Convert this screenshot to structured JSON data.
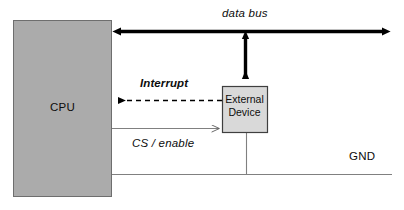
{
  "diagram": {
    "blocks": [
      {
        "id": "cpu",
        "label": "CPU",
        "fill": "#ababab",
        "stroke": "#595959",
        "x": 13,
        "y": 20,
        "w": 99,
        "h": 177
      },
      {
        "id": "external-device",
        "label": "External Device",
        "label_line1": "External",
        "label_line2": "Device",
        "fill": "#d9d9d9",
        "stroke": "#404040",
        "x": 222,
        "y": 86,
        "w": 46,
        "h": 47
      }
    ],
    "connections": [
      {
        "id": "data-bus",
        "label": "data bus",
        "style": "solid-thick",
        "arrows": "both",
        "color": "#000000",
        "orientation": "horizontal"
      },
      {
        "id": "device-bus-drop",
        "label": "",
        "style": "solid-thick",
        "arrows": "both",
        "color": "#000000",
        "orientation": "vertical"
      },
      {
        "id": "interrupt",
        "label": "Interrupt",
        "style": "dashed",
        "arrows": "start",
        "color": "#000000",
        "orientation": "horizontal"
      },
      {
        "id": "cs-enable",
        "label": "CS / enable",
        "style": "solid-thin",
        "arrows": "end",
        "color": "#7f7f7f",
        "orientation": "horizontal"
      },
      {
        "id": "ground",
        "label": "GND",
        "style": "solid-thin",
        "arrows": "none",
        "color": "#7f7f7f",
        "orientation": "horizontal"
      }
    ]
  }
}
